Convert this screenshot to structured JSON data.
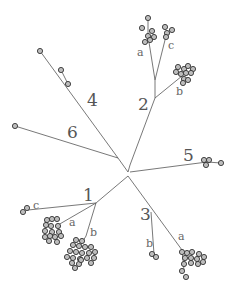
{
  "diagram": {
    "type": "unrooted-phylogenetic-tree",
    "clades": [
      {
        "id": "1",
        "label": "1",
        "subclades": [
          {
            "label": "a"
          },
          {
            "label": "b"
          },
          {
            "label": "c"
          }
        ]
      },
      {
        "id": "2",
        "label": "2",
        "subclades": [
          {
            "label": "a"
          },
          {
            "label": "b"
          },
          {
            "label": "c"
          }
        ]
      },
      {
        "id": "3",
        "label": "3",
        "subclades": [
          {
            "label": "a"
          },
          {
            "label": "b"
          }
        ]
      },
      {
        "id": "4",
        "label": "4",
        "subclades": []
      },
      {
        "id": "5",
        "label": "5",
        "subclades": []
      },
      {
        "id": "6",
        "label": "6",
        "subclades": []
      }
    ],
    "colors": {
      "edge": "#555555",
      "leaf_fill": "#bdbdbd",
      "leaf_stroke": "#333333",
      "label": "#555555"
    }
  }
}
